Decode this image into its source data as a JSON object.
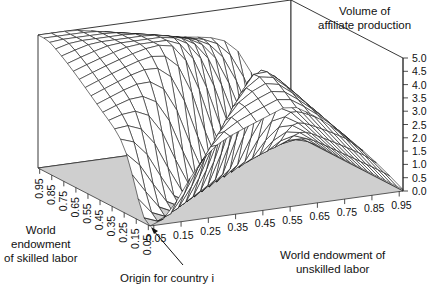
{
  "chart_data": {
    "type": "surface3d",
    "title": "",
    "zlabel": "Volume of affiliate production",
    "xlabel": "World endowment of unskilled labor",
    "ylabel": "World endowment of skilled labor",
    "annotation": "Origin for country i",
    "x_ticks": [
      "0.05",
      "0.15",
      "0.25",
      "0.35",
      "0.45",
      "0.55",
      "0.65",
      "0.75",
      "0.85",
      "0.95"
    ],
    "y_ticks": [
      "0.05",
      "0.15",
      "0.25",
      "0.35",
      "0.45",
      "0.55",
      "0.65",
      "0.75",
      "0.85",
      "0.95"
    ],
    "z_ticks": [
      "0.0",
      "0.5",
      "1.0",
      "1.5",
      "2.0",
      "2.5",
      "3.0",
      "3.5",
      "4.0",
      "4.5",
      "5.0"
    ],
    "zlim": [
      0,
      5.0
    ],
    "xlim": [
      0.05,
      0.95
    ],
    "ylim": [
      0.05,
      0.95
    ],
    "grid_resolution": 19,
    "surface_peaks": [
      {
        "x": 0.05,
        "y": 0.95,
        "z": 4.2
      },
      {
        "x": 0.95,
        "y": 0.05,
        "z": 0.3
      },
      {
        "x": 0.95,
        "y": 0.95,
        "z": 4.8
      },
      {
        "x": 0.55,
        "y": 0.95,
        "z": 4.5
      }
    ]
  },
  "labels": {
    "zaxis": [
      "Volume of",
      "affiliate production"
    ],
    "xaxis": [
      "World endowment of",
      "unskilled labor"
    ],
    "yaxis": [
      "World",
      "endowment",
      "of skilled labor"
    ],
    "origin": "Origin for country i"
  }
}
